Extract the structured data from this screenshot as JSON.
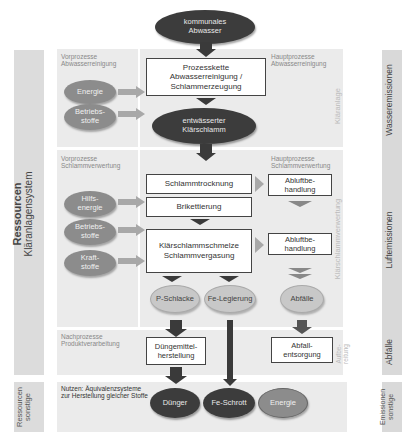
{
  "top_node": {
    "label": "kommunales\nAbwasser"
  },
  "left_band": {
    "title": "Ressourcen",
    "subtitle": "Kläranlagensystem"
  },
  "left_band_bottom": {
    "label": "Ressourcen\nsonstige"
  },
  "right_bands": {
    "water": "Wasseremissionen",
    "air": "Luftemissionen",
    "waste": "Abfälle",
    "other": "Emissionen\nsonstige"
  },
  "vertical_section_labels": {
    "klaeranlage": "Kläranlage",
    "klaerschlammverwertung": "Klärschlammverwertung",
    "aufbereitung": "Aufbe-\nreitung"
  },
  "sections": {
    "vorprozesse_abwasser": "Vorprozesse\nAbwasserreinigung",
    "hauptprozesse_abwasser": "Hauptprozesse\nAbwasserreinigung",
    "vorprozesse_schlamm": "Vorprozesse\nSchlammverwertung",
    "hauptprozesse_schlamm": "Hauptprozesse\nSchlammverwertung",
    "nachprozesse": "Nachprozesse\nProduktverarbeitung",
    "nutzen": "Nutzen: Äquivalenzsysteme\nzur Herstellung gleicher Stoffe"
  },
  "inputs_abwasser": [
    {
      "label": "Energie"
    },
    {
      "label": "Betriebs-\nstoffe"
    }
  ],
  "inputs_schlamm": [
    {
      "label": "Hilfs-\nenergie"
    },
    {
      "label": "Betriebs-\nstoffe"
    },
    {
      "label": "Kraft-\nstoffe"
    }
  ],
  "process_boxes": {
    "prozesskette": "Prozesskette\nAbwasserreinigung /\nSchlammerzeugung",
    "schlammtrocknung": "Schlammtrocknung",
    "brikettierung": "Brikettierung",
    "schmelze": "Klärschlammschmelze\nSchlammvergasung",
    "abluft1": "Abluftbe-\nhandlung",
    "abluft2": "Abluftbe-\nhandlung",
    "duengemittel": "Düngemittel-\nherstellung",
    "abfallentsorgung": "Abfall-\nentsorgung"
  },
  "intermediate_nodes": {
    "klaerschlamm": "entwässerter\nKlärschlamm",
    "p_schlacke": "P-Schlacke",
    "fe_legierung": "Fe-Legierung",
    "abfaelle": "Abfälle"
  },
  "output_nodes": {
    "duenger": "Dünger",
    "fe_schrott": "Fe-Schrott",
    "energie": "Energie"
  }
}
